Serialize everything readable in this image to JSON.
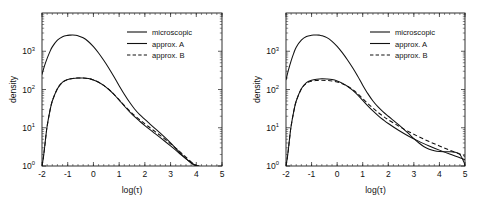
{
  "figure": {
    "panels": [
      {
        "id": "left",
        "xlabel": "log(τ)",
        "ylabel": "density",
        "xticks": [
          "-2",
          "-1",
          "0",
          "1",
          "2",
          "3",
          "4",
          "5"
        ],
        "yticks": [
          "0",
          "1",
          "2",
          "3"
        ],
        "ymantissa": "10",
        "legend": [
          "microscopic",
          "approx. A",
          "approx. B"
        ]
      },
      {
        "id": "right",
        "xlabel": "log(τ)",
        "ylabel": "density",
        "xticks": [
          "-2",
          "-1",
          "0",
          "1",
          "2",
          "3",
          "4",
          "5"
        ],
        "yticks": [
          "0",
          "1",
          "2",
          "3"
        ],
        "ymantissa": "10",
        "legend": [
          "microscopic",
          "approx. A",
          "approx. B"
        ]
      }
    ]
  },
  "chart_data": [
    {
      "type": "line",
      "title": "",
      "panel": "left",
      "xlabel": "log(τ)",
      "ylabel": "density",
      "xlim": [
        -2,
        5
      ],
      "ylim": [
        1,
        10000
      ],
      "yscale": "log",
      "grid": false,
      "legend_position": "top-right",
      "xticks": [
        -2,
        -1,
        0,
        1,
        2,
        3,
        4,
        5
      ],
      "yticks": [
        1,
        10,
        100,
        1000
      ],
      "ytick_labels": [
        "10^0",
        "10^1",
        "10^2",
        "10^3"
      ],
      "series": [
        {
          "name": "microscopic",
          "style": "solid",
          "x": [
            -2.0,
            -1.9,
            -1.8,
            -1.7,
            -1.6,
            -1.4,
            -1.2,
            -1.0,
            -0.9,
            -0.8,
            -0.7,
            -0.6,
            -0.4,
            -0.2,
            0.0,
            0.2,
            0.4,
            0.6,
            0.8,
            1.0,
            1.2,
            1.4,
            1.6,
            1.8,
            2.0,
            2.2,
            2.4,
            2.6,
            2.8,
            3.0,
            3.2,
            3.4,
            3.6,
            3.8,
            3.9,
            4.0,
            4.05,
            4.1
          ],
          "values": [
            250,
            420,
            650,
            950,
            1300,
            1950,
            2400,
            2600,
            2640,
            2650,
            2620,
            2540,
            2250,
            1800,
            1320,
            900,
            580,
            360,
            215,
            125,
            75,
            47,
            31,
            22,
            16.5,
            12.5,
            9.5,
            7.2,
            5.4,
            4.0,
            2.9,
            2.1,
            1.55,
            1.2,
            1.08,
            1.02,
            1.0,
            1.0
          ]
        },
        {
          "name": "approx. A",
          "style": "solid",
          "x": [
            -2.0,
            -1.95,
            -1.9,
            -1.85,
            -1.8,
            -1.7,
            -1.6,
            -1.4,
            -1.2,
            -1.0,
            -0.8,
            -0.6,
            -0.4,
            -0.2,
            0.0,
            0.2,
            0.4,
            0.6,
            0.8,
            1.0,
            1.2,
            1.4,
            1.6,
            1.8,
            2.0,
            2.2,
            2.4,
            2.6,
            2.8,
            3.0,
            3.2,
            3.4,
            3.6,
            3.8,
            3.95,
            4.05,
            4.1
          ],
          "values": [
            1.0,
            1.6,
            3.0,
            6.0,
            11.0,
            26.0,
            50.0,
            105.0,
            155.0,
            182.0,
            195.0,
            200.0,
            199.0,
            193.0,
            178.0,
            155.0,
            128.0,
            100.0,
            74.0,
            53.0,
            37.0,
            26.5,
            19.5,
            14.8,
            11.4,
            8.9,
            7.0,
            5.5,
            4.3,
            3.35,
            2.6,
            2.0,
            1.55,
            1.22,
            1.07,
            1.0,
            1.0
          ]
        },
        {
          "name": "approx. B",
          "style": "dashed",
          "x": [
            -2.0,
            -1.95,
            -1.9,
            -1.85,
            -1.8,
            -1.7,
            -1.6,
            -1.4,
            -1.2,
            -1.0,
            -0.8,
            -0.6,
            -0.4,
            -0.2,
            0.0,
            0.2,
            0.4,
            0.6,
            0.8,
            1.0,
            1.2,
            1.4,
            1.6,
            1.8,
            2.0,
            2.2,
            2.4,
            2.6,
            2.8,
            3.0,
            3.2,
            3.4,
            3.6,
            3.8,
            3.95,
            4.05,
            4.1
          ],
          "values": [
            1.0,
            1.6,
            3.0,
            6.0,
            11.0,
            26.0,
            50.0,
            105.0,
            155.0,
            182.0,
            195.0,
            200.0,
            199.0,
            193.0,
            178.0,
            155.0,
            128.0,
            101.0,
            75.0,
            54.0,
            38.5,
            28.0,
            21.0,
            16.2,
            12.6,
            10.0,
            7.9,
            6.3,
            4.9,
            3.8,
            2.95,
            2.25,
            1.7,
            1.28,
            1.09,
            1.0,
            1.0
          ]
        }
      ]
    },
    {
      "type": "line",
      "title": "",
      "panel": "right",
      "xlabel": "log(τ)",
      "ylabel": "density",
      "xlim": [
        -2,
        5
      ],
      "ylim": [
        1,
        10000
      ],
      "yscale": "log",
      "grid": false,
      "legend_position": "top-right",
      "xticks": [
        -2,
        -1,
        0,
        1,
        2,
        3,
        4,
        5
      ],
      "yticks": [
        1,
        10,
        100,
        1000
      ],
      "ytick_labels": [
        "10^0",
        "10^1",
        "10^2",
        "10^3"
      ],
      "series": [
        {
          "name": "microscopic",
          "style": "solid",
          "x": [
            -2.0,
            -1.9,
            -1.8,
            -1.7,
            -1.6,
            -1.4,
            -1.2,
            -1.0,
            -0.9,
            -0.8,
            -0.7,
            -0.6,
            -0.4,
            -0.2,
            0.0,
            0.2,
            0.4,
            0.6,
            0.8,
            1.0,
            1.2,
            1.4,
            1.6,
            1.8,
            2.0,
            2.2,
            2.4,
            2.6,
            2.8,
            3.0,
            3.2,
            3.4,
            3.6,
            3.8,
            4.0,
            4.2,
            4.4,
            4.6,
            4.8,
            4.95,
            5.0
          ],
          "values": [
            180,
            330,
            560,
            880,
            1280,
            1950,
            2420,
            2620,
            2660,
            2670,
            2640,
            2560,
            2270,
            1820,
            1340,
            920,
            600,
            375,
            225,
            130,
            78,
            50,
            35,
            26,
            20,
            15.5,
            12.0,
            9.2,
            7.0,
            5.2,
            4.0,
            3.2,
            2.75,
            2.5,
            2.38,
            2.35,
            2.35,
            2.3,
            2.0,
            1.3,
            1.0
          ]
        },
        {
          "name": "approx. A",
          "style": "solid",
          "x": [
            -2.0,
            -1.95,
            -1.9,
            -1.85,
            -1.8,
            -1.7,
            -1.6,
            -1.4,
            -1.2,
            -1.0,
            -0.8,
            -0.6,
            -0.4,
            -0.2,
            0.0,
            0.2,
            0.4,
            0.6,
            0.8,
            1.0,
            1.2,
            1.4,
            1.6,
            1.8,
            2.0,
            2.4,
            2.8,
            3.2,
            3.6,
            4.0,
            4.4,
            4.8,
            5.0
          ],
          "values": [
            1.0,
            1.6,
            3.0,
            6.0,
            11.0,
            26.0,
            50.0,
            105.0,
            152.0,
            175.0,
            186.0,
            190.0,
            188.0,
            182.0,
            168.0,
            147.0,
            122.0,
            96.0,
            72.0,
            52.0,
            37.5,
            27.5,
            20.8,
            16.2,
            12.9,
            8.6,
            6.0,
            4.4,
            3.35,
            2.6,
            2.05,
            1.65,
            1.45
          ]
        },
        {
          "name": "approx. B",
          "style": "dashed",
          "x": [
            -2.0,
            -1.95,
            -1.9,
            -1.85,
            -1.8,
            -1.7,
            -1.6,
            -1.4,
            -1.2,
            -1.0,
            -0.8,
            -0.6,
            -0.4,
            -0.2,
            0.0,
            0.2,
            0.4,
            0.6,
            0.8,
            1.0,
            1.2,
            1.4,
            1.6,
            1.8,
            2.0,
            2.4,
            2.8,
            3.2,
            3.6,
            4.0,
            4.4,
            4.8,
            5.0
          ],
          "values": [
            1.0,
            1.6,
            3.0,
            6.0,
            11.0,
            26.0,
            50.0,
            103.0,
            145.0,
            165.0,
            172.0,
            174.0,
            172.0,
            167.0,
            157.0,
            142.0,
            123.0,
            100.0,
            78.0,
            58.0,
            43.0,
            32.5,
            25.2,
            20.0,
            16.2,
            11.1,
            7.9,
            5.8,
            4.35,
            3.35,
            2.6,
            2.05,
            1.8
          ]
        }
      ]
    }
  ]
}
